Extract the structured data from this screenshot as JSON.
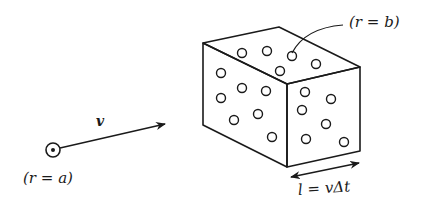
{
  "diagram": {
    "type": "physics-collision-volume",
    "labels": {
      "projectile": "(r = a)",
      "target_particle": "(r = b)",
      "velocity": "v",
      "length": "l = vΔt"
    },
    "projectile": {
      "center": [
        53,
        150
      ],
      "radius": 7,
      "dot_radius": 2
    },
    "velocity_arrow": {
      "from": [
        60,
        148
      ],
      "to": [
        165,
        124
      ]
    },
    "box": {
      "vertices": {
        "top_left": [
          203,
          43
        ],
        "top_back": [
          279,
          27
        ],
        "top_right": [
          360,
          67
        ],
        "top_front": [
          287,
          84
        ],
        "bottom_left": [
          203,
          125
        ],
        "bottom_front": [
          287,
          167
        ],
        "bottom_right": [
          360,
          151
        ]
      }
    },
    "particles": {
      "top_face": [
        [
          242,
          53
        ],
        [
          267,
          51
        ],
        [
          292,
          56
        ],
        [
          280,
          71
        ],
        [
          316,
          64
        ]
      ],
      "front_face": [
        [
          221,
          73
        ],
        [
          242,
          88
        ],
        [
          266,
          91
        ],
        [
          221,
          98
        ],
        [
          234,
          120
        ],
        [
          258,
          114
        ],
        [
          272,
          137
        ]
      ],
      "right_face": [
        [
          305,
          92
        ],
        [
          331,
          99
        ],
        [
          302,
          110
        ],
        [
          326,
          124
        ],
        [
          306,
          139
        ],
        [
          344,
          142
        ]
      ],
      "radius": 4.5
    },
    "leader_line": {
      "from": [
        343,
        25
      ],
      "control": [
        305,
        28
      ],
      "to": [
        292,
        53
      ]
    },
    "length_arrow": {
      "from": [
        291,
        177
      ],
      "to": [
        359,
        163
      ]
    },
    "colors": {
      "stroke": "#1a1a1a",
      "background": "#ffffff"
    }
  }
}
